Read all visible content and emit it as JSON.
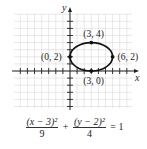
{
  "chart_data": {
    "type": "line",
    "title": "",
    "xlabel": "x",
    "ylabel": "y",
    "xlim": [
      -8,
      8
    ],
    "ylim": [
      -5,
      8
    ],
    "grid": true,
    "curve": "ellipse",
    "center": [
      3,
      2
    ],
    "a": 3,
    "b": 2,
    "points": [
      {
        "label": "(3, 4)",
        "x": 3,
        "y": 4
      },
      {
        "label": "(0, 2)",
        "x": 0,
        "y": 2
      },
      {
        "label": "(6, 2)",
        "x": 6,
        "y": 2
      },
      {
        "label": "(3, 0)",
        "x": 3,
        "y": 0
      }
    ],
    "equation": {
      "num1": "(x − 3)²",
      "den1": "9",
      "plus": "+",
      "num2": "(y − 2)²",
      "den2": "4",
      "rhs": "= 1"
    }
  },
  "axis": {
    "x_label": "x",
    "y_label": "y"
  }
}
